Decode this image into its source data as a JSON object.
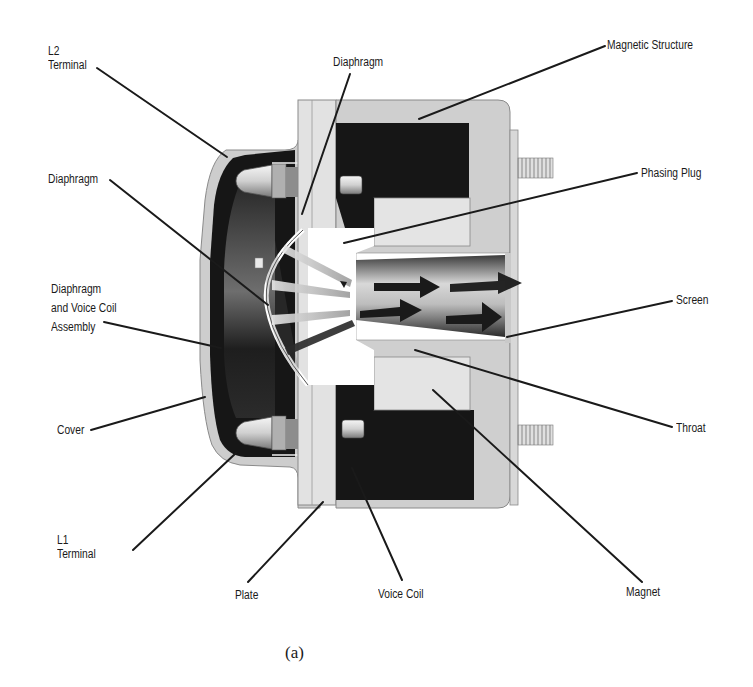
{
  "figure": {
    "caption": "(a)",
    "labels": {
      "l2_terminal": [
        "L2",
        "Terminal"
      ],
      "diaphragm_top": "Diaphragm",
      "magnetic_structure": "Magnetic Structure",
      "diaphragm_left": "Diaphragm",
      "phasing_plug": "Phasing Plug",
      "diaphragm_voice_coil_assembly": [
        "Diaphragm",
        "and Voice Coil",
        "Assembly"
      ],
      "screen": "Screen",
      "cover": "Cover",
      "throat": "Throat",
      "l1_terminal": [
        "L1",
        "Terminal"
      ],
      "plate": "Plate",
      "voice_coil": "Voice Coil",
      "magnet": "Magnet"
    }
  },
  "colors": {
    "background": "#ffffff",
    "ink": "#1a1a1a",
    "dark_fill": "#161616",
    "light_gray": "#cfcfcf",
    "mid_gray": "#9a9a9a",
    "pale": "#e6e6e6"
  }
}
